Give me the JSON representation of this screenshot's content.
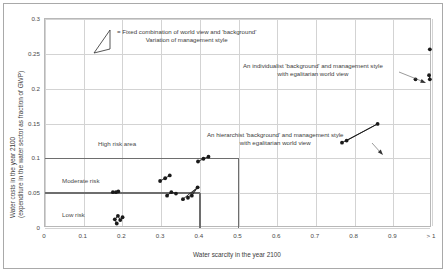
{
  "figure": {
    "background_color": "#ffffff",
    "frame_color": "#a9a9a9",
    "marker_color": "#1a1a1a",
    "grid_color": "#d3d3d3",
    "threshold_color": "#6e6e6e"
  },
  "axes": {
    "x_title": "Water scarcity in the year 2100",
    "y_title_line1": "Water costs in the year 2100",
    "y_title_line2": "(expenditure in the water sector as fraction of GWP)",
    "x_ticks": [
      "0",
      "0.1",
      "0.2",
      "0.3",
      "0.4",
      "0.5",
      "0.6",
      "0.7",
      "0.8",
      "0.9",
      "> 1"
    ],
    "y_ticks": [
      "0",
      "0.05",
      "0.1",
      "0.15",
      "0.2",
      "0.25",
      "0.3"
    ]
  },
  "zones": {
    "high": "High risk area",
    "moderate": "Moderate risk",
    "low": "Low risk"
  },
  "legend": {
    "line1": "= Fixed combination of world view and 'background'",
    "line2": "Variation of management style"
  },
  "annotations": {
    "individualist_line1": "An individualist 'background' and management style",
    "individualist_line2": "with egalitarian world view",
    "hierarchist_line1": "An hierarchist 'background' and management style",
    "hierarchist_line2": "with egalitarian world view"
  },
  "chart_data": {
    "type": "scatter",
    "title": "",
    "xlabel": "Water scarcity in the year 2100",
    "ylabel": "Water costs in the year 2100 (expenditure in the water sector as fraction of GWP)",
    "xlim": [
      0,
      1
    ],
    "ylim": [
      0,
      0.3
    ],
    "x_ticks": [
      0,
      0.1,
      0.2,
      0.3,
      0.4,
      0.5,
      0.6,
      0.7,
      0.8,
      0.9,
      1
    ],
    "y_ticks": [
      0,
      0.05,
      0.1,
      0.15,
      0.2,
      0.25,
      0.3
    ],
    "grid": true,
    "legend_position": "top-center",
    "risk_thresholds": {
      "horizontal": [
        {
          "y": 0.05,
          "x_from": 0.0,
          "x_to": 0.4,
          "label": "low/moderate boundary"
        },
        {
          "y": 0.1,
          "x_from": 0.0,
          "x_to": 0.5,
          "label": "moderate/high boundary"
        }
      ],
      "vertical": [
        {
          "x": 0.4,
          "y_from": 0.0,
          "y_to": 0.05
        },
        {
          "x": 0.5,
          "y_from": 0.0,
          "y_to": 0.1
        }
      ]
    },
    "clusters": [
      {
        "name": "egalitarian-low-costs-a",
        "points": [
          [
            0.178,
            0.05
          ],
          [
            0.186,
            0.05
          ],
          [
            0.192,
            0.051
          ]
        ],
        "links": [
          [
            0,
            1
          ],
          [
            1,
            2
          ]
        ]
      },
      {
        "name": "egalitarian-low-costs-b",
        "points": [
          [
            0.183,
            0.011
          ],
          [
            0.191,
            0.016
          ],
          [
            0.197,
            0.01
          ],
          [
            0.203,
            0.014
          ],
          [
            0.188,
            0.005
          ]
        ],
        "links": [
          [
            0,
            1
          ],
          [
            1,
            2
          ],
          [
            2,
            3
          ],
          [
            0,
            4
          ]
        ]
      },
      {
        "name": "mid-cluster-left",
        "points": [
          [
            0.3,
            0.066
          ],
          [
            0.313,
            0.07
          ],
          [
            0.325,
            0.074
          ]
        ],
        "links": [
          [
            0,
            1
          ],
          [
            1,
            2
          ]
        ]
      },
      {
        "name": "mid-cluster-upper",
        "points": [
          [
            0.398,
            0.094
          ],
          [
            0.412,
            0.098
          ],
          [
            0.425,
            0.101
          ]
        ],
        "links": [
          [
            0,
            1
          ],
          [
            1,
            2
          ]
        ]
      },
      {
        "name": "mid-cluster-center",
        "points": [
          [
            0.318,
            0.045
          ],
          [
            0.329,
            0.05
          ],
          [
            0.341,
            0.048
          ]
        ],
        "links": [
          [
            0,
            1
          ],
          [
            1,
            2
          ]
        ]
      },
      {
        "name": "mid-cluster-right-fan",
        "points": [
          [
            0.359,
            0.04
          ],
          [
            0.372,
            0.042
          ],
          [
            0.397,
            0.057
          ],
          [
            0.382,
            0.045
          ]
        ],
        "links": [
          [
            0,
            2
          ],
          [
            1,
            2
          ],
          [
            3,
            2
          ]
        ]
      },
      {
        "name": "hierarchist-elongated",
        "points": [
          [
            0.77,
            0.121
          ],
          [
            0.782,
            0.124
          ],
          [
            0.862,
            0.148
          ]
        ],
        "links": [
          [
            0,
            2
          ],
          [
            1,
            2
          ]
        ]
      },
      {
        "name": "individualist-top",
        "points": [
          [
            0.997,
            0.255
          ]
        ],
        "links": []
      },
      {
        "name": "individualist-pair",
        "points": [
          [
            0.995,
            0.218
          ],
          [
            0.997,
            0.212
          ]
        ],
        "links": [
          [
            0,
            1
          ]
        ]
      },
      {
        "name": "individualist-tail",
        "points": [
          [
            0.96,
            0.212
          ]
        ],
        "links": []
      }
    ]
  }
}
